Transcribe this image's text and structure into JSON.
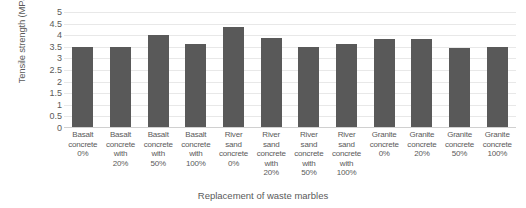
{
  "chart_data": {
    "type": "bar",
    "title": "",
    "xlabel": "Replacement of waste marbles",
    "ylabel": "Tensile strength (MPa)",
    "ylim": [
      0,
      5
    ],
    "ytick_step": 0.5,
    "ytick_labels": [
      "5",
      "4.5",
      "4",
      "3.5",
      "3",
      "2.5",
      "2",
      "1.5",
      "1",
      "0.5",
      "0"
    ],
    "ytick_values": [
      5,
      4.5,
      4,
      3.5,
      3,
      2.5,
      2,
      1.5,
      1,
      0.5,
      0
    ],
    "grid": true,
    "legend": "none",
    "bar_color": "#595959",
    "gridline_color": "#e8e8e8",
    "categories": [
      "Basalt concrete 0%",
      "Basalt concrete with 20%",
      "Basalt concrete with 50%",
      "Basalt concrete with 100%",
      "River sand concrete 0%",
      "River sand concrete with 20%",
      "River sand concrete with 50%",
      "River sand concrete with 100%",
      "Granite concrete 0%",
      "Granite concrete 20%",
      "Granite concrete 50%",
      "Granite concrete 100%"
    ],
    "category_lines": [
      [
        "Basalt",
        "concrete",
        "0%"
      ],
      [
        "Basalt",
        "concrete",
        "with",
        "20%"
      ],
      [
        "Basalt",
        "concrete",
        "with",
        "50%"
      ],
      [
        "Basalt",
        "concrete",
        "with",
        "100%"
      ],
      [
        "River",
        "sand",
        "concrete",
        "0%"
      ],
      [
        "River",
        "sand",
        "concrete",
        "with",
        "20%"
      ],
      [
        "River",
        "sand",
        "concrete",
        "with",
        "50%"
      ],
      [
        "River",
        "sand",
        "concrete",
        "with",
        "100%"
      ],
      [
        "Granite",
        "concrete",
        "0%"
      ],
      [
        "Granite",
        "concrete",
        "20%"
      ],
      [
        "Granite",
        "concrete",
        "50%"
      ],
      [
        "Granite",
        "concrete",
        "100%"
      ]
    ],
    "values": [
      3.5,
      3.5,
      4.0,
      3.6,
      4.35,
      3.9,
      3.5,
      3.6,
      3.85,
      3.85,
      3.45,
      3.5
    ]
  }
}
